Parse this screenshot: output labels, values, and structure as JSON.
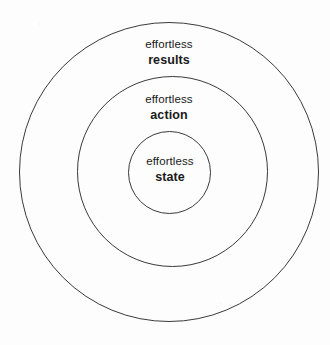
{
  "diagram": {
    "type": "concentric-circles",
    "stroke_color": "#3a3a3a",
    "background_color": "#fdfdfd",
    "text_color": "#1a1a1a",
    "rings": [
      {
        "id": "outer",
        "level": 3,
        "prefix": "effortless",
        "term": "results"
      },
      {
        "id": "middle",
        "level": 2,
        "prefix": "effortless",
        "term": "action"
      },
      {
        "id": "inner",
        "level": 1,
        "prefix": "effortless",
        "term": "state"
      }
    ]
  }
}
